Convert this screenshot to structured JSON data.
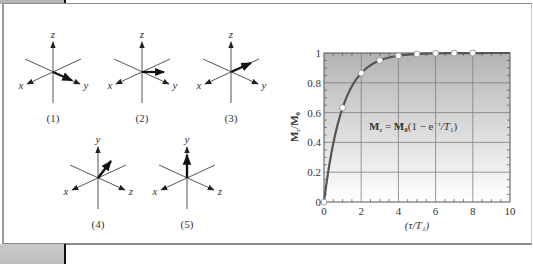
{
  "figure": {
    "left_panel": {
      "diagrams": [
        {
          "id": "1",
          "label": "(1)",
          "vertical_axis": "z",
          "left_axis": "x",
          "right_axis": "y",
          "vector_direction": "along +y"
        },
        {
          "id": "2",
          "label": "(2)",
          "vertical_axis": "z",
          "left_axis": "x",
          "right_axis": "y",
          "vector_direction": "horizontal, between +y and -x"
        },
        {
          "id": "3",
          "label": "(3)",
          "vertical_axis": "z",
          "left_axis": "x",
          "right_axis": "y",
          "vector_direction": "along -x"
        },
        {
          "id": "4",
          "label": "(4)",
          "vertical_axis": "y",
          "left_axis": "x",
          "right_axis": "z",
          "vector_direction": "between +y and -x"
        },
        {
          "id": "5",
          "label": "(5)",
          "vertical_axis": "y",
          "left_axis": "x",
          "right_axis": "z",
          "vector_direction": "along +y"
        }
      ]
    },
    "right_panel": {
      "ylabel_main": "M",
      "ylabel_sub1": "z",
      "ylabel_slash": "/",
      "ylabel_main2": "M",
      "ylabel_sub2": "0",
      "xlabel": "(τ/T₁)",
      "equation": {
        "lhs": "M",
        "lhs_sub": "z",
        "equals": " = ",
        "rhs_m": "M",
        "rhs_sub": "0",
        "rhs_rest": "(1 − e",
        "exp": "−τ",
        "tail": "/T",
        "tail_sub": "1",
        "close": ")"
      },
      "x_ticks": [
        "0",
        "2",
        "4",
        "6",
        "8",
        "10"
      ],
      "y_ticks": [
        "0",
        "0.2",
        "0.4",
        "0.6",
        "0.8",
        "1"
      ]
    }
  },
  "chart_data": {
    "type": "line",
    "title": "",
    "xlabel": "(τ/T1)",
    "ylabel": "Mz/M0",
    "xlim": [
      0,
      10
    ],
    "ylim": [
      0,
      1
    ],
    "grid": true,
    "annotation": "Mz = M0(1 − e^(−τ/T1))",
    "series": [
      {
        "name": "Mz = M0(1 - e^(-τ/T1)) curve",
        "x": [
          0,
          0.25,
          0.5,
          0.75,
          1,
          1.5,
          2,
          2.5,
          3,
          3.5,
          4,
          5,
          6,
          7,
          8,
          9,
          10
        ],
        "values": [
          0,
          0.221,
          0.393,
          0.528,
          0.632,
          0.777,
          0.865,
          0.918,
          0.95,
          0.97,
          0.982,
          0.993,
          0.998,
          0.999,
          1.0,
          1.0,
          1.0
        ]
      },
      {
        "name": "data points (open circles)",
        "x": [
          0,
          1,
          2,
          3,
          4,
          5,
          6,
          7,
          8
        ],
        "values": [
          0,
          0.632,
          0.865,
          0.95,
          0.982,
          0.993,
          0.998,
          0.999,
          1.0
        ]
      }
    ],
    "x_ticks": [
      0,
      2,
      4,
      6,
      8,
      10
    ],
    "y_ticks": [
      0,
      0.2,
      0.4,
      0.6,
      0.8,
      1
    ]
  }
}
